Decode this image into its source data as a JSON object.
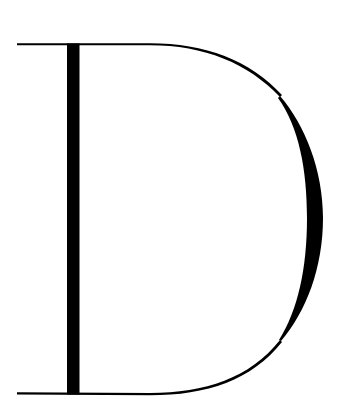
{
  "glyph": {
    "character": "D",
    "style": "high-contrast didone serif capital",
    "color": "#000000",
    "background": "#ffffff"
  }
}
